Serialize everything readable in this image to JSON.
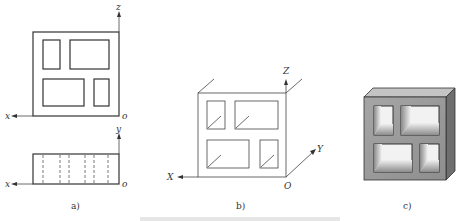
{
  "panels": {
    "a": {
      "caption": "a)",
      "front_view": {
        "axis_vertical": "z",
        "axis_horizontal": "x",
        "origin": "o"
      },
      "top_view": {
        "axis_vertical": "y",
        "axis_horizontal": "x",
        "origin": "o"
      }
    },
    "b": {
      "caption": "b)",
      "axes": {
        "z": "Z",
        "x": "X",
        "y": "Y",
        "origin": "O"
      }
    },
    "c": {
      "caption": "c)"
    }
  },
  "colors": {
    "line": "#333333",
    "block_front": "#9a9a9a",
    "block_top": "#c4c4c4",
    "block_side": "#6e6e6e",
    "hole_light": "#f2f2f2"
  }
}
